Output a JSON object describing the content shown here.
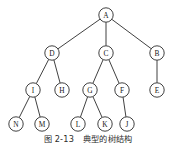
{
  "figure": {
    "caption_label": "图 2-13",
    "caption_text": "典型的树结构",
    "stroke_color": "#2b2b2b",
    "node_fill": "#ffffff",
    "background": "#ffffff"
  },
  "tree": {
    "node_radius": 7.2,
    "nodes": [
      {
        "id": "A",
        "label": "A",
        "x": 106,
        "y": 15,
        "level": 0
      },
      {
        "id": "D",
        "label": "D",
        "x": 52,
        "y": 53,
        "level": 1
      },
      {
        "id": "C",
        "label": "C",
        "x": 106,
        "y": 53,
        "level": 1
      },
      {
        "id": "B",
        "label": "B",
        "x": 157,
        "y": 53,
        "level": 1
      },
      {
        "id": "I",
        "label": "I",
        "x": 33,
        "y": 90,
        "level": 2
      },
      {
        "id": "H",
        "label": "H",
        "x": 62,
        "y": 90,
        "level": 2
      },
      {
        "id": "G",
        "label": "G",
        "x": 90,
        "y": 90,
        "level": 2
      },
      {
        "id": "F",
        "label": "F",
        "x": 122,
        "y": 90,
        "level": 2
      },
      {
        "id": "E",
        "label": "E",
        "x": 157,
        "y": 90,
        "level": 2
      },
      {
        "id": "N",
        "label": "N",
        "x": 16,
        "y": 124,
        "level": 3
      },
      {
        "id": "M",
        "label": "M",
        "x": 42,
        "y": 124,
        "level": 3
      },
      {
        "id": "L",
        "label": "L",
        "x": 78,
        "y": 124,
        "level": 3
      },
      {
        "id": "K",
        "label": "K",
        "x": 105,
        "y": 124,
        "level": 3
      },
      {
        "id": "J",
        "label": "J",
        "x": 127,
        "y": 124,
        "level": 3
      }
    ],
    "edges": [
      {
        "from": "A",
        "to": "D"
      },
      {
        "from": "A",
        "to": "C"
      },
      {
        "from": "A",
        "to": "B"
      },
      {
        "from": "D",
        "to": "I"
      },
      {
        "from": "D",
        "to": "H"
      },
      {
        "from": "C",
        "to": "G"
      },
      {
        "from": "C",
        "to": "F"
      },
      {
        "from": "B",
        "to": "E"
      },
      {
        "from": "I",
        "to": "N"
      },
      {
        "from": "I",
        "to": "M"
      },
      {
        "from": "G",
        "to": "L"
      },
      {
        "from": "G",
        "to": "K"
      },
      {
        "from": "F",
        "to": "J"
      }
    ]
  }
}
